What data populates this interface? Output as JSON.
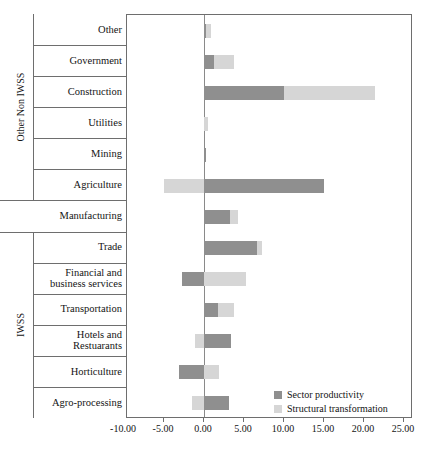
{
  "chart_data": {
    "type": "bar",
    "orientation": "horizontal",
    "stacked": true,
    "title": "",
    "xlabel": "",
    "ylabel": "",
    "xlim": [
      -10.0,
      25.0
    ],
    "xticks": [
      -10.0,
      -5.0,
      0.0,
      5.0,
      10.0,
      15.0,
      20.0,
      25.0
    ],
    "xtick_labels": [
      "-10.00",
      "-5.00",
      "0.00",
      "5.00",
      "10.00",
      "15.00",
      "20.00",
      "25.00"
    ],
    "grid": false,
    "legend_position": "inside-bottom-right",
    "categories": [
      "Other",
      "Government",
      "Construction",
      "Utilities",
      "Mining",
      "Agriculture",
      "Manufacturing",
      "Trade",
      "Financial and business services",
      "Transportation",
      "Hotels and Restuarants",
      "Horticulture",
      "Agro-processing"
    ],
    "category_labels": [
      [
        "Other"
      ],
      [
        "Government"
      ],
      [
        "Construction"
      ],
      [
        "Utilities"
      ],
      [
        "Mining"
      ],
      [
        "Agriculture"
      ],
      [
        "Manufacturing"
      ],
      [
        "Trade"
      ],
      [
        "Financial and",
        "business services"
      ],
      [
        "Transportation"
      ],
      [
        "Hotels and",
        "Restuarants"
      ],
      [
        "Horticulture"
      ],
      [
        "Agro-processing"
      ]
    ],
    "series": [
      {
        "name": "Sector productivity",
        "color": "#8f8f8f",
        "values": [
          0.3,
          1.2,
          10.0,
          0.0,
          0.2,
          15.0,
          3.2,
          6.6,
          -2.8,
          1.7,
          3.4,
          -3.1,
          3.1
        ]
      },
      {
        "name": "Structural transformation",
        "color": "#d6d6d6",
        "values": [
          0.6,
          2.6,
          11.4,
          0.5,
          0.0,
          -5.0,
          1.0,
          0.7,
          5.3,
          2.0,
          -1.1,
          1.9,
          -1.5
        ]
      }
    ],
    "group_brackets": [
      {
        "label": "Other Non IWSS",
        "categories": [
          "Other",
          "Government",
          "Construction",
          "Utilities",
          "Mining",
          "Agriculture"
        ]
      },
      {
        "label": "",
        "categories": [
          "Manufacturing"
        ]
      },
      {
        "label": "IWSS",
        "categories": [
          "Trade",
          "Financial and business services",
          "Transportation",
          "Hotels and Restuarants",
          "Horticulture",
          "Agro-processing"
        ]
      }
    ],
    "legend": [
      {
        "label": "Sector productivity",
        "color": "#8f8f8f"
      },
      {
        "label": "Structural transformation",
        "color": "#d6d6d6"
      }
    ]
  }
}
